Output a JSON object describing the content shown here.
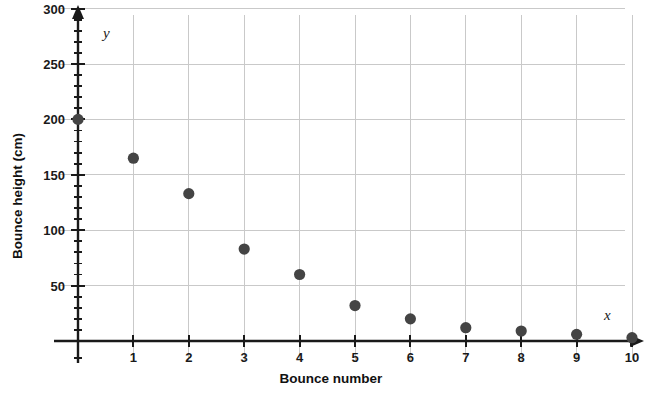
{
  "chart_data": {
    "type": "scatter",
    "title": "",
    "xlabel": "Bounce number",
    "ylabel": "Bounce height (cm)",
    "x_axis_variable": "x",
    "y_axis_variable": "y",
    "xlim": [
      0,
      10
    ],
    "ylim": [
      0,
      300
    ],
    "x_ticks": [
      1,
      2,
      3,
      4,
      5,
      6,
      7,
      8,
      9,
      10
    ],
    "y_ticks": [
      50,
      100,
      150,
      200,
      250,
      300
    ],
    "y_minor_tick_step": 10,
    "grid": true,
    "legend": "none",
    "marker_color": "#444444",
    "gridline_color": "#c9c9c9",
    "axis_color": "#1a1a1a",
    "x": [
      0,
      1,
      2,
      3,
      4,
      5,
      6,
      7,
      8,
      9,
      10
    ],
    "values": [
      200,
      165,
      133,
      83,
      60,
      32,
      20,
      12,
      9,
      6,
      3
    ],
    "points": [
      {
        "x": 0,
        "y": 200
      },
      {
        "x": 1,
        "y": 165
      },
      {
        "x": 2,
        "y": 133
      },
      {
        "x": 3,
        "y": 83
      },
      {
        "x": 4,
        "y": 60
      },
      {
        "x": 5,
        "y": 32
      },
      {
        "x": 6,
        "y": 20
      },
      {
        "x": 7,
        "y": 12
      },
      {
        "x": 8,
        "y": 9
      },
      {
        "x": 9,
        "y": 6
      },
      {
        "x": 10,
        "y": 3
      }
    ]
  }
}
